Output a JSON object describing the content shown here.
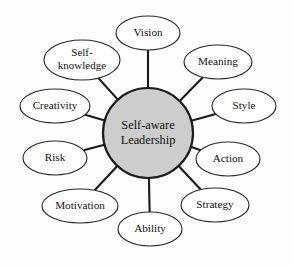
{
  "diagram": {
    "title": "Self-aware Leadership",
    "type": "radial-spoke-hub",
    "background_color": "#fdfdfd",
    "hub": {
      "label_line1": "Self-aware",
      "label_line2": "Leadership",
      "fill_color": "#cdcdcd",
      "stroke_color": "#1c1c1c",
      "center_x": 148,
      "center_y": 133,
      "radius": 45
    },
    "satellites": [
      {
        "id": "vision",
        "label": "Vision",
        "lines": [
          "Vision"
        ],
        "cx": 148,
        "cy": 33,
        "rx": 32,
        "ry": 17,
        "angle_deg": 270
      },
      {
        "id": "meaning",
        "label": "Meaning",
        "lines": [
          "Meaning"
        ],
        "cx": 218,
        "cy": 62,
        "rx": 34,
        "ry": 17,
        "angle_deg": 315
      },
      {
        "id": "style",
        "label": "Style",
        "lines": [
          "Style"
        ],
        "cx": 244,
        "cy": 106,
        "rx": 32,
        "ry": 17,
        "angle_deg": 0
      },
      {
        "id": "action",
        "label": "Action",
        "lines": [
          "Action"
        ],
        "cx": 228,
        "cy": 159,
        "rx": 32,
        "ry": 17,
        "angle_deg": 35
      },
      {
        "id": "strategy",
        "label": "Strategy",
        "lines": [
          "Strategy"
        ],
        "cx": 215,
        "cy": 205,
        "rx": 34,
        "ry": 17,
        "angle_deg": 60
      },
      {
        "id": "ability",
        "label": "Ability",
        "lines": [
          "Ability"
        ],
        "cx": 150,
        "cy": 229,
        "rx": 32,
        "ry": 17,
        "angle_deg": 90
      },
      {
        "id": "motivation",
        "label": "Motivation",
        "lines": [
          "Motivation"
        ],
        "cx": 80,
        "cy": 206,
        "rx": 38,
        "ry": 17,
        "angle_deg": 125
      },
      {
        "id": "risk",
        "label": "Risk",
        "lines": [
          "Risk"
        ],
        "cx": 55,
        "cy": 158,
        "rx": 32,
        "ry": 17,
        "angle_deg": 150
      },
      {
        "id": "creativity",
        "label": "Creativity",
        "lines": [
          "Creativity"
        ],
        "cx": 55,
        "cy": 106,
        "rx": 35,
        "ry": 17,
        "angle_deg": 180
      },
      {
        "id": "self-knowledge",
        "label": "Self-knowledge",
        "lines": [
          "Self-",
          "knowledge"
        ],
        "cx": 82,
        "cy": 60,
        "rx": 38,
        "ry": 20,
        "angle_deg": 220
      }
    ]
  }
}
